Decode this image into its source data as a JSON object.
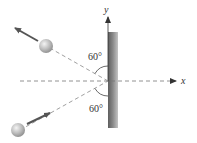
{
  "diagram": {
    "axes": {
      "x_label": "x",
      "y_label": "y"
    },
    "angles": {
      "upper": "60°",
      "lower": "60°"
    },
    "colors": {
      "wall_dark": "#6a6a6a",
      "wall_light": "#b8b8b8",
      "dash": "#888888",
      "arrow": "#666666",
      "ball": "#bdbdbd"
    }
  }
}
